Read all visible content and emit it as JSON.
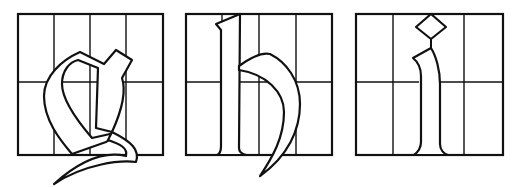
{
  "figure": {
    "stroke_color": "#111111",
    "background": "#ffffff",
    "panels": [
      {
        "letter": "g",
        "grid": {
          "columns": 4,
          "rows": 2
        }
      },
      {
        "letter": "h",
        "grid": {
          "columns": 4,
          "rows": 2
        }
      },
      {
        "letter": "i",
        "grid": {
          "columns": 4,
          "rows": 2
        }
      }
    ]
  }
}
